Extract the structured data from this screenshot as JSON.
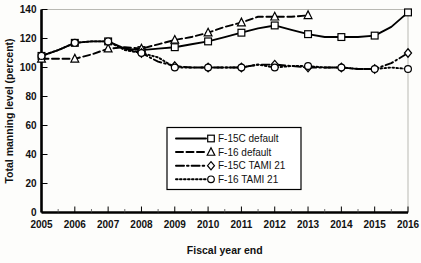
{
  "chart_data": {
    "type": "line",
    "title": "",
    "xlabel": "Fiscal year end",
    "ylabel": "Total manning level (percent)",
    "xlim": [
      2005,
      2016
    ],
    "ylim": [
      0,
      140
    ],
    "ytick_values": [
      0,
      20,
      40,
      60,
      80,
      100,
      120,
      140
    ],
    "ytick_labels": [
      "0",
      "20",
      "40",
      "60",
      "80",
      "100",
      "120",
      "140"
    ],
    "xtick_values": [
      2005,
      2006,
      2007,
      2008,
      2009,
      2010,
      2011,
      2012,
      2013,
      2014,
      2015,
      2016
    ],
    "xtick_labels": [
      "2005",
      "2006",
      "2007",
      "2008",
      "2009",
      "2010",
      "2011",
      "2012",
      "2013",
      "2014",
      "2015",
      "2016"
    ],
    "grid": false,
    "minor_xticks": true,
    "legend_position": "center",
    "series": [
      {
        "name": "F-15C default",
        "marker": "square",
        "dash": "solid",
        "x": [
          2005,
          2005.5,
          2006,
          2006.5,
          2007,
          2007.5,
          2008,
          2008.5,
          2009,
          2009.5,
          2010,
          2010.5,
          2011,
          2011.5,
          2012,
          2012.5,
          2013,
          2013.5,
          2014,
          2014.5,
          2015,
          2015.5,
          2016
        ],
        "y": [
          108,
          112,
          117,
          118,
          118,
          113,
          112,
          113,
          114,
          116,
          118,
          121,
          124,
          127,
          129,
          126,
          123,
          121,
          121,
          121,
          122,
          128,
          138
        ]
      },
      {
        "name": "F-16 default",
        "marker": "triangle",
        "dash": "dashed",
        "x": [
          2005,
          2005.5,
          2006,
          2006.5,
          2007,
          2007.5,
          2008,
          2008.5,
          2009,
          2009.5,
          2010,
          2010.5,
          2011,
          2011.5,
          2012,
          2012.5,
          2013
        ],
        "y": [
          106,
          106,
          106,
          109,
          113,
          114,
          113,
          116,
          119,
          121,
          124,
          128,
          131,
          135,
          135,
          135,
          136
        ]
      },
      {
        "name": "F-15C TAMI 21",
        "marker": "diamond",
        "dash": "dashdot",
        "x": [
          2007.5,
          2008,
          2008.5,
          2009,
          2009.5,
          2010,
          2010.5,
          2011,
          2011.5,
          2012,
          2012.5,
          2013,
          2013.5,
          2014,
          2014.5,
          2015,
          2015.5,
          2016
        ],
        "y": [
          113,
          110,
          104,
          101,
          100,
          100,
          100,
          100,
          102,
          102,
          101,
          100,
          100,
          100,
          99,
          99,
          103,
          110
        ]
      },
      {
        "name": "F-16 TAMI 21",
        "marker": "circle",
        "dash": "dotted",
        "x": [
          2005,
          2005.5,
          2006,
          2006.5,
          2007,
          2007.5,
          2008,
          2008.5,
          2009,
          2009.5,
          2010,
          2010.5,
          2011,
          2011.5,
          2012,
          2012.5,
          2013,
          2013.5,
          2014,
          2014.5,
          2015,
          2015.5,
          2016
        ],
        "y": [
          108,
          112,
          117,
          118,
          118,
          112,
          110,
          107,
          100,
          100,
          100,
          100,
          100,
          102,
          100,
          101,
          101,
          100,
          100,
          99,
          99,
          100,
          99
        ]
      }
    ]
  },
  "legend": {
    "entries": [
      {
        "label": "F-15C default"
      },
      {
        "label": "F-16 default"
      },
      {
        "label": "F-15C TAMI 21"
      },
      {
        "label": "F-16 TAMI 21"
      }
    ]
  }
}
